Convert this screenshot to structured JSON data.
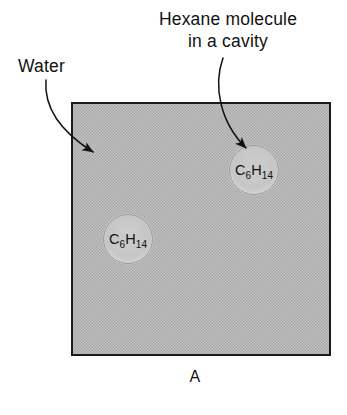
{
  "figure": {
    "panel_letter": "A",
    "background_color": "#ffffff"
  },
  "callouts": [
    {
      "name": "water-label",
      "text": "Water",
      "x": 18,
      "y": 72
    },
    {
      "name": "hexane-label-line1",
      "text": "Hexane molecule",
      "x": 228,
      "y": 25
    },
    {
      "name": "hexane-label-line2",
      "text": "in a cavity",
      "x": 228,
      "y": 47
    }
  ],
  "water_region": {
    "name": "water-bulk",
    "fill_color": "#b6b6b6",
    "border_color": "#1a1a1a",
    "x": 72,
    "y": 103,
    "width": 258,
    "height": 252
  },
  "cavities": [
    {
      "name": "hexane-cavity-upper-right",
      "formula_main_1": "C",
      "formula_sub_1": "6",
      "formula_main_2": "H",
      "formula_sub_2": "14",
      "cx": 254,
      "cy": 170,
      "r": 25,
      "fill_color": "#c3c3c3"
    },
    {
      "name": "hexane-cavity-lower-left",
      "formula_main_1": "C",
      "formula_sub_1": "6",
      "formula_main_2": "H",
      "formula_sub_2": "14",
      "cx": 128,
      "cy": 239,
      "r": 25,
      "fill_color": "#c3c3c3"
    }
  ],
  "leaders": {
    "water_arrow_name": "water-leader-arrow",
    "hexane_arrow_name": "hexane-leader-arrow"
  }
}
